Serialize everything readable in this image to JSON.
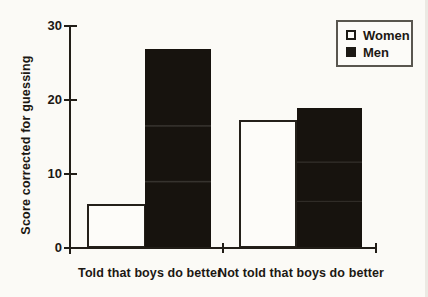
{
  "figure": {
    "background_color": "#fbfaf6",
    "ink_color": "#211d17"
  },
  "chart_data": {
    "type": "bar",
    "title": "",
    "categories": [
      "Told that boys do better",
      "Not told that boys do better"
    ],
    "series": [
      {
        "name": "Women",
        "style": "open",
        "fill": "#fdfcf9",
        "values": [
          6.0,
          17.3
        ]
      },
      {
        "name": "Men",
        "style": "filled",
        "fill": "#17130e",
        "values": [
          26.9,
          18.9
        ]
      }
    ],
    "xlabel": "",
    "ylabel": "Score corrected for guessing",
    "ylim": [
      0,
      30
    ],
    "yticks": [
      0,
      10,
      20,
      30
    ],
    "grid": false,
    "legend_position": "top-right",
    "legend_entries": [
      "Women",
      "Men"
    ]
  }
}
